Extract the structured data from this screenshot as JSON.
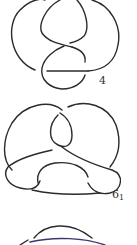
{
  "figure": {
    "stroke_color": "#2b2b2b",
    "second_strand_color": "#3a3a6a",
    "knots": [
      {
        "id": "figure-eight",
        "label_main": "4",
        "label_sub": ""
      },
      {
        "id": "stevedore",
        "label_main": "6",
        "label_sub": "1"
      },
      {
        "id": "partial-knot",
        "label_main": "",
        "label_sub": ""
      }
    ]
  }
}
